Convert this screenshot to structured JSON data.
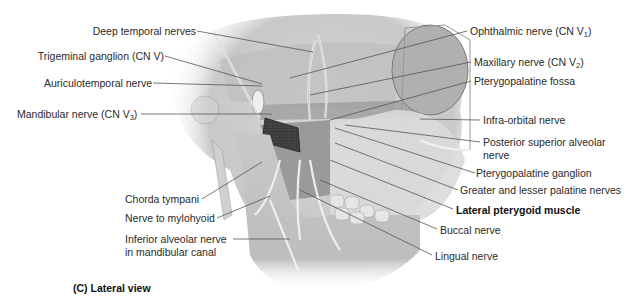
{
  "figure": {
    "caption": "(C) Lateral view",
    "view": "lateral"
  },
  "labels_left": [
    {
      "id": "deep-temporal-nerves",
      "text": "Deep temporal nerves",
      "sub": ""
    },
    {
      "id": "trigeminal-ganglion",
      "text": "Trigeminal ganglion (CN V)",
      "sub": ""
    },
    {
      "id": "auriculotemporal-nerve",
      "text": "Auriculotemporal nerve",
      "sub": ""
    },
    {
      "id": "mandibular-nerve",
      "text": "Mandibular nerve (CN V",
      "sub": "3",
      "suffix": ")"
    },
    {
      "id": "chorda-tympani",
      "text": "Chorda tympani",
      "sub": ""
    },
    {
      "id": "nerve-to-mylohyoid",
      "text": "Nerve to mylohyoid",
      "sub": ""
    },
    {
      "id": "inferior-alveolar-nerve-1",
      "text": "Inferior alveolar nerve",
      "sub": ""
    },
    {
      "id": "inferior-alveolar-nerve-2",
      "text": "in mandibular canal",
      "sub": ""
    }
  ],
  "labels_right": [
    {
      "id": "ophthalmic-nerve",
      "text": "Ophthalmic nerve (CN V",
      "sub": "1",
      "suffix": ")"
    },
    {
      "id": "maxillary-nerve",
      "text": "Maxillary nerve (CN V",
      "sub": "2",
      "suffix": ")"
    },
    {
      "id": "pterygopalatine-fossa",
      "text": "Pterygopalatine fossa",
      "sub": ""
    },
    {
      "id": "infra-orbital-nerve",
      "text": "Infra-orbital nerve",
      "sub": ""
    },
    {
      "id": "posterior-superior-alveolar-1",
      "text": "Posterior superior alveolar",
      "sub": ""
    },
    {
      "id": "posterior-superior-alveolar-2",
      "text": "nerve",
      "sub": ""
    },
    {
      "id": "pterygopalatine-ganglion",
      "text": "Pterygopalatine ganglion",
      "sub": ""
    },
    {
      "id": "palatine-nerves",
      "text": "Greater and lesser palatine nerves",
      "sub": ""
    },
    {
      "id": "lateral-pterygoid-muscle",
      "text": "Lateral pterygoid muscle",
      "sub": "",
      "bold": true
    },
    {
      "id": "buccal-nerve",
      "text": "Buccal nerve",
      "sub": ""
    },
    {
      "id": "lingual-nerve",
      "text": "Lingual nerve",
      "sub": ""
    }
  ],
  "colors": {
    "background": "#ffffff",
    "label_text": "#2a2a2a",
    "leader_line": "#555555",
    "bone_light": "#e4e4e4",
    "bone_mid": "#c4c4c4",
    "bone_dark": "#8c8c8c",
    "nerve": "#f2f2f2",
    "cut_nerve_dark": "#3a3a3a"
  }
}
